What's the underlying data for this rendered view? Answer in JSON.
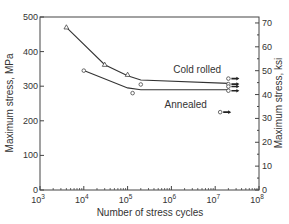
{
  "chart_data": {
    "type": "line",
    "title": "",
    "xlabel": "Number of stress cycles",
    "ylabel": "Maximum stress, MPa",
    "y2label": "Maximum stress, ksi",
    "xscale": "log",
    "xlim": [
      1000,
      100000000
    ],
    "ylim": [
      0,
      500
    ],
    "y2lim": [
      0,
      72.5
    ],
    "grid": false,
    "x_ticks": [
      {
        "value": 1000,
        "base": "10",
        "exp": "3"
      },
      {
        "value": 10000,
        "base": "10",
        "exp": "4"
      },
      {
        "value": 100000,
        "base": "10",
        "exp": "5"
      },
      {
        "value": 1000000,
        "base": "10",
        "exp": "6"
      },
      {
        "value": 10000000,
        "base": "10",
        "exp": "7"
      },
      {
        "value": 100000000,
        "base": "10",
        "exp": "8"
      }
    ],
    "y_ticks": [
      "0",
      "100",
      "200",
      "300",
      "400",
      "500"
    ],
    "y2_ticks": [
      "0",
      "10",
      "20",
      "30",
      "40",
      "50",
      "60",
      "70"
    ],
    "series": [
      {
        "name": "Cold rolled",
        "curve": [
          [
            4000,
            470
          ],
          [
            30000,
            362
          ],
          [
            100000,
            330
          ],
          [
            200000,
            318
          ],
          [
            20000000,
            308
          ]
        ],
        "points": [
          {
            "x": 4000,
            "y": 470,
            "marker": "triangle"
          },
          {
            "x": 30000,
            "y": 362,
            "marker": "triangle"
          },
          {
            "x": 100000,
            "y": 333,
            "marker": "triangle"
          },
          {
            "x": 200000,
            "y": 305,
            "marker": "circle"
          },
          {
            "x": 20000000,
            "y": 322,
            "marker": "circle",
            "runout": true
          },
          {
            "x": 20000000,
            "y": 306,
            "marker": "circle",
            "runout": true
          },
          {
            "x": 20000000,
            "y": 299,
            "marker": "circle",
            "runout": true
          }
        ],
        "label_pos": {
          "x": 1100000,
          "y": 337
        }
      },
      {
        "name": "Annealed",
        "curve": [
          [
            10000,
            345
          ],
          [
            100000,
            295
          ],
          [
            200000,
            290
          ],
          [
            20000000,
            290
          ]
        ],
        "points": [
          {
            "x": 10000,
            "y": 345,
            "marker": "circle"
          },
          {
            "x": 130000,
            "y": 280,
            "marker": "circle"
          },
          {
            "x": 20000000,
            "y": 287,
            "marker": "circle",
            "runout": true
          },
          {
            "x": 13000000,
            "y": 225,
            "marker": "circle",
            "runout": true
          }
        ],
        "label_pos": {
          "x": 700000,
          "y": 238
        }
      }
    ]
  }
}
